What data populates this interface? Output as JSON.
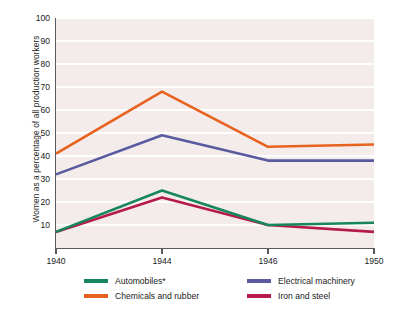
{
  "chart_data": {
    "type": "line",
    "title": "",
    "subtitle": "",
    "xlabel": "",
    "ylabel": "Women as a percentage of all production workers",
    "x": [
      "1940",
      "1944",
      "1946",
      "1950"
    ],
    "categories": [
      "1940",
      "1944",
      "1946",
      "1950"
    ],
    "ylim": [
      0,
      100
    ],
    "xlim": [
      "1940",
      "1950"
    ],
    "yticks": [
      10,
      20,
      30,
      40,
      50,
      60,
      70,
      80,
      90,
      100
    ],
    "ytick_labels": [
      "10",
      "20",
      "30",
      "40",
      "50",
      "60",
      "70",
      "80",
      "90",
      "100"
    ],
    "xtick_labels": [
      "1940",
      "1944",
      "1946",
      "1950"
    ],
    "grid": "horizontal",
    "legend_position": "bottom",
    "plot_background": "#f3ecea",
    "gridline_color": "#ffffff",
    "axis_color": "#5b5b5b",
    "series": [
      {
        "name": "Automobiles*",
        "color": "#17855f",
        "values": [
          7,
          25,
          10,
          11
        ]
      },
      {
        "name": "Chemicals and rubber",
        "color": "#e8621f",
        "values": [
          41,
          68,
          44,
          45
        ]
      },
      {
        "name": "Electrical machinery",
        "color": "#5a5aa0",
        "values": [
          32,
          49,
          38,
          38
        ]
      },
      {
        "name": "Iron and steel",
        "color": "#b51a4a",
        "values": [
          7,
          22,
          10,
          7
        ]
      }
    ],
    "annotations": []
  },
  "legend": {
    "items": [
      {
        "label": "Automobiles*",
        "color": "#17855f"
      },
      {
        "label": "Chemicals and rubber",
        "color": "#e8621f"
      },
      {
        "label": "Electrical machinery",
        "color": "#5a5aa0"
      },
      {
        "label": "Iron and steel",
        "color": "#b51a4a"
      }
    ]
  }
}
